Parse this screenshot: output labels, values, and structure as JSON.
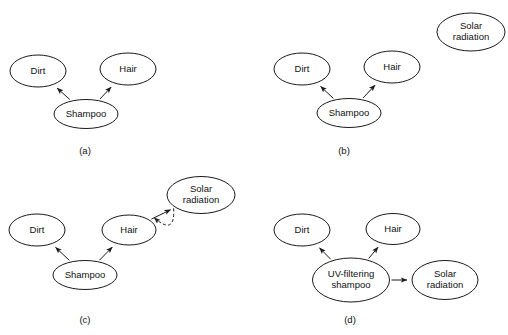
{
  "figure": {
    "width": 508,
    "height": 335,
    "background": "#ffffff",
    "stroke_color": "#1a1a1a",
    "text_color": "#111111"
  },
  "panels": [
    {
      "id": "a",
      "caption": "(a)",
      "caption_x": 85,
      "caption_y": 151,
      "nodes": [
        {
          "id": "dirt",
          "label": "Dirt",
          "lines": [
            "Dirt"
          ],
          "cx": 38,
          "cy": 71,
          "rx": 28,
          "ry": 16
        },
        {
          "id": "hair",
          "label": "Hair",
          "lines": [
            "Hair"
          ],
          "cx": 128,
          "cy": 69,
          "rx": 28,
          "ry": 16
        },
        {
          "id": "shampoo",
          "label": "Shampoo",
          "lines": [
            "Shampoo"
          ],
          "cx": 86,
          "cy": 114,
          "rx": 32,
          "ry": 14.5
        }
      ],
      "edges": [
        {
          "from": "shampoo",
          "to": "dirt",
          "style": "solid",
          "arrow": "end"
        },
        {
          "from": "shampoo",
          "to": "hair",
          "style": "solid",
          "arrow": "end"
        }
      ]
    },
    {
      "id": "b",
      "caption": "(b)",
      "caption_x": 344,
      "caption_y": 151,
      "nodes": [
        {
          "id": "dirt",
          "label": "Dirt",
          "lines": [
            "Dirt"
          ],
          "cx": 302,
          "cy": 69,
          "rx": 28,
          "ry": 16
        },
        {
          "id": "hair",
          "label": "Hair",
          "lines": [
            "Hair"
          ],
          "cx": 392,
          "cy": 67,
          "rx": 28,
          "ry": 16
        },
        {
          "id": "shampoo",
          "label": "Shampoo",
          "lines": [
            "Shampoo"
          ],
          "cx": 349,
          "cy": 113,
          "rx": 32,
          "ry": 14.5
        },
        {
          "id": "solar",
          "label": "Solar radiation",
          "lines": [
            "Solar",
            "radiation"
          ],
          "cx": 471,
          "cy": 32,
          "rx": 34,
          "ry": 19
        }
      ],
      "edges": [
        {
          "from": "shampoo",
          "to": "dirt",
          "style": "solid",
          "arrow": "end"
        },
        {
          "from": "shampoo",
          "to": "hair",
          "style": "solid",
          "arrow": "end"
        }
      ]
    },
    {
      "id": "c",
      "caption": "(c)",
      "caption_x": 85,
      "caption_y": 320,
      "nodes": [
        {
          "id": "dirt",
          "label": "Dirt",
          "lines": [
            "Dirt"
          ],
          "cx": 37,
          "cy": 230,
          "rx": 28,
          "ry": 16
        },
        {
          "id": "hair",
          "label": "Hair",
          "lines": [
            "Hair"
          ],
          "cx": 129,
          "cy": 230,
          "rx": 27,
          "ry": 15
        },
        {
          "id": "shampoo",
          "label": "Shampoo",
          "lines": [
            "Shampoo"
          ],
          "cx": 85,
          "cy": 275,
          "rx": 32,
          "ry": 14.5
        },
        {
          "id": "solar",
          "label": "Solar radiation",
          "lines": [
            "Solar",
            "radiation"
          ],
          "cx": 201,
          "cy": 195,
          "rx": 34,
          "ry": 18.5
        }
      ],
      "edges": [
        {
          "from": "shampoo",
          "to": "dirt",
          "style": "solid",
          "arrow": "end"
        },
        {
          "from": "shampoo",
          "to": "hair",
          "style": "solid",
          "arrow": "end"
        },
        {
          "from": "hair",
          "to": "solar",
          "style": "solid",
          "arrow": "end"
        },
        {
          "from": "solar",
          "to": "hair",
          "style": "dashed",
          "arrow": "end",
          "curved": true,
          "bow": -26
        }
      ]
    },
    {
      "id": "d",
      "caption": "(d)",
      "caption_x": 350,
      "caption_y": 320,
      "nodes": [
        {
          "id": "dirt",
          "label": "Dirt",
          "lines": [
            "Dirt"
          ],
          "cx": 302,
          "cy": 230,
          "rx": 28,
          "ry": 16
        },
        {
          "id": "hair",
          "label": "Hair",
          "lines": [
            "Hair"
          ],
          "cx": 393,
          "cy": 229,
          "rx": 27,
          "ry": 15.5
        },
        {
          "id": "uvshampoo",
          "label": "UV-filtering shampoo",
          "lines": [
            "UV-filtering",
            "shampoo"
          ],
          "cx": 351,
          "cy": 280,
          "rx": 38.5,
          "ry": 22
        },
        {
          "id": "solar",
          "label": "Solar radiation",
          "lines": [
            "Solar",
            "radiation"
          ],
          "cx": 445,
          "cy": 280,
          "rx": 33,
          "ry": 19.5
        }
      ],
      "edges": [
        {
          "from": "uvshampoo",
          "to": "dirt",
          "style": "solid",
          "arrow": "end"
        },
        {
          "from": "uvshampoo",
          "to": "hair",
          "style": "solid",
          "arrow": "end"
        },
        {
          "from": "uvshampoo",
          "to": "solar",
          "style": "solid",
          "arrow": "end"
        }
      ]
    }
  ]
}
